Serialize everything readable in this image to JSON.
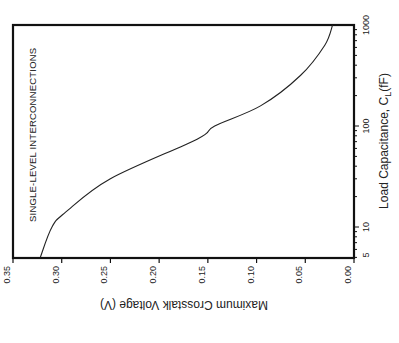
{
  "chart_data": {
    "type": "line",
    "orientation": "rotated-90-clockwise",
    "title": "",
    "xlabel": "Load Capacitance, C_L (fF)",
    "xlabel_main": "Load Capacitance, C",
    "xlabel_sub": "L",
    "xlabel_unit": "(fF)",
    "ylabel": "Maximum Crosstalk Voltage (V)",
    "xscale": "log",
    "xlim": [
      5,
      1000
    ],
    "ylim": [
      0.0,
      0.35
    ],
    "x_ticks": [
      "5",
      "10",
      "100",
      "1000"
    ],
    "y_ticks": [
      "0.35",
      "0.30",
      "0.25",
      "0.20",
      "0.15",
      "0.10",
      "0.05",
      "0.00"
    ],
    "grid": false,
    "annotations": [
      "SINGLE-LEVEL INTERCONNECTIONS"
    ],
    "series": [
      {
        "name": "Single-level interconnections",
        "x": [
          5,
          10,
          14,
          30,
          74,
          100,
          158,
          316,
          631,
          1000
        ],
        "values": [
          0.322,
          0.31,
          0.296,
          0.25,
          0.161,
          0.143,
          0.096,
          0.055,
          0.03,
          0.022
        ]
      }
    ]
  }
}
